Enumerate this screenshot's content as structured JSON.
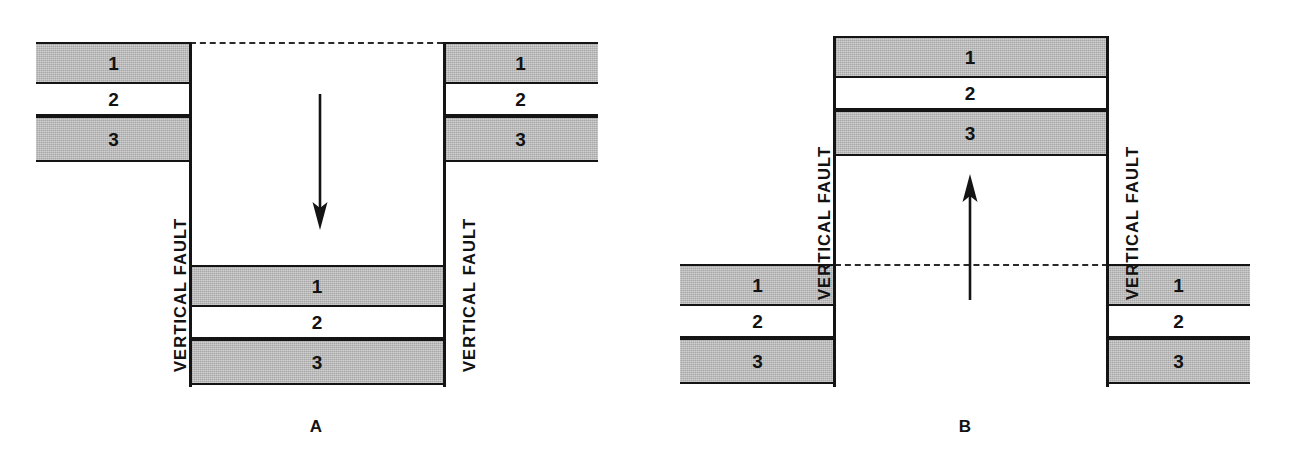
{
  "figure": {
    "background_color": "#ffffff",
    "bed_shaded_color": "#a8a8a8",
    "line_color": "#141414"
  },
  "beds": {
    "one": "1",
    "two": "2",
    "three": "3"
  },
  "labels": {
    "vertical_fault": "VERTICAL FAULT"
  },
  "panels": [
    {
      "id": "A",
      "caption": "A",
      "motion": "down",
      "arrow_name": "down-arrow",
      "description": "Central block downthrown between two vertical faults",
      "blocks": [
        {
          "name": "left-wall-block",
          "beds": [
            {
              "label": "1",
              "fill": "shaded"
            },
            {
              "label": "2",
              "fill": "blank"
            },
            {
              "label": "3",
              "fill": "shaded"
            }
          ]
        },
        {
          "name": "center-downthrown-block",
          "beds": [
            {
              "label": "1",
              "fill": "shaded"
            },
            {
              "label": "2",
              "fill": "blank"
            },
            {
              "label": "3",
              "fill": "shaded"
            }
          ]
        },
        {
          "name": "right-wall-block",
          "beds": [
            {
              "label": "1",
              "fill": "shaded"
            },
            {
              "label": "2",
              "fill": "blank"
            },
            {
              "label": "3",
              "fill": "shaded"
            }
          ]
        }
      ],
      "faults": [
        {
          "name": "left-fault",
          "label": "VERTICAL FAULT"
        },
        {
          "name": "right-fault",
          "label": "VERTICAL FAULT"
        }
      ]
    },
    {
      "id": "B",
      "caption": "B",
      "motion": "up",
      "arrow_name": "up-arrow",
      "description": "Central block upthrown between two vertical faults",
      "blocks": [
        {
          "name": "left-wall-block",
          "beds": [
            {
              "label": "1",
              "fill": "shaded"
            },
            {
              "label": "2",
              "fill": "blank"
            },
            {
              "label": "3",
              "fill": "shaded"
            }
          ]
        },
        {
          "name": "center-upthrown-block",
          "beds": [
            {
              "label": "1",
              "fill": "shaded"
            },
            {
              "label": "2",
              "fill": "blank"
            },
            {
              "label": "3",
              "fill": "shaded"
            }
          ]
        },
        {
          "name": "right-wall-block",
          "beds": [
            {
              "label": "1",
              "fill": "shaded"
            },
            {
              "label": "2",
              "fill": "blank"
            },
            {
              "label": "3",
              "fill": "shaded"
            }
          ]
        }
      ],
      "faults": [
        {
          "name": "left-fault",
          "label": "VERTICAL FAULT"
        },
        {
          "name": "right-fault",
          "label": "VERTICAL FAULT"
        }
      ]
    }
  ]
}
